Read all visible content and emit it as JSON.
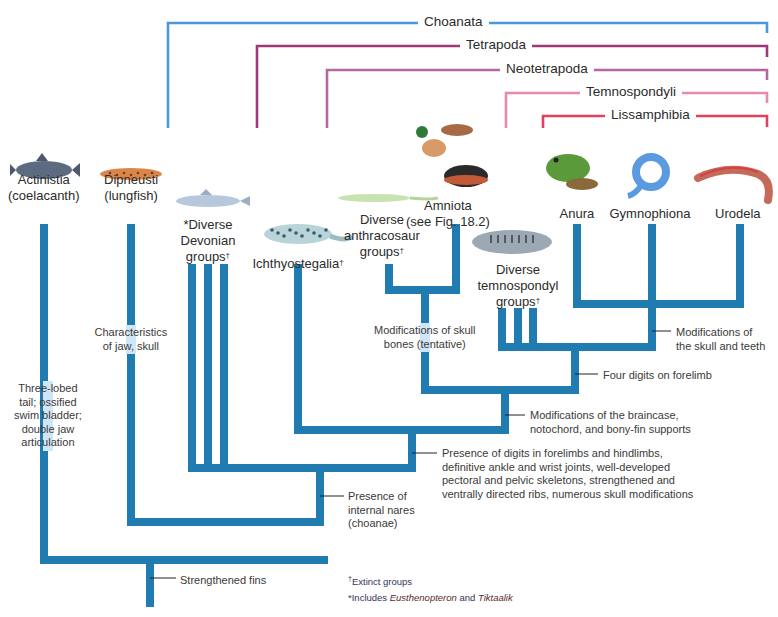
{
  "colors": {
    "trunk": "#1f7bb0",
    "trunk_highlight": "#cfe6f7",
    "choanata": "#4a97dd",
    "tetrapoda": "#a03878",
    "neotetrapoda": "#b5679f",
    "temnospondyli": "#e88aae",
    "lissamphibia": "#e2405c",
    "text": "#2b2b2b"
  },
  "clades": [
    {
      "id": "choanata",
      "label": "Choanata",
      "x1": 168,
      "x2": 767,
      "y": 23,
      "drop_left": 128,
      "drop_right": 33,
      "label_x": 418
    },
    {
      "id": "tetrapoda",
      "label": "Tetrapoda",
      "x1": 257,
      "x2": 767,
      "y": 46,
      "drop_left": 128,
      "drop_right": 57,
      "label_x": 460
    },
    {
      "id": "neotetrapoda",
      "label": "Neotetrapoda",
      "x1": 327,
      "x2": 767,
      "y": 70,
      "drop_left": 128,
      "drop_right": 80,
      "label_x": 500
    },
    {
      "id": "temnospondyli",
      "label": "Temnospondyli",
      "x1": 506,
      "x2": 767,
      "y": 93,
      "drop_left": 128,
      "drop_right": 103,
      "label_x": 580
    },
    {
      "id": "lissamphibia",
      "label": "Lissamphibia",
      "x1": 543,
      "x2": 767,
      "y": 116,
      "drop_left": 128,
      "drop_right": 127,
      "label_x": 605
    }
  ],
  "taxa": [
    {
      "id": "actinistia",
      "line1": "Actinistia",
      "line2": "(coelacanth)",
      "cx": 44,
      "y": 172,
      "extinct": false,
      "animal": "coelacanth"
    },
    {
      "id": "dipneusti",
      "line1": "Dipneusti",
      "line2": "(lungfish)",
      "cx": 131,
      "y": 172,
      "extinct": false,
      "animal": "lungfish"
    },
    {
      "id": "devonian",
      "line1": "*Diverse",
      "line2": "Devonian",
      "line3": "groups",
      "cx": 208,
      "y": 217,
      "extinct": true,
      "animal": "devonian-fish"
    },
    {
      "id": "ichthyostegalia",
      "line1": "Ichthyostegalia",
      "cx": 298,
      "y": 256,
      "extinct": true,
      "animal": "ichthyostega"
    },
    {
      "id": "anthracosaur",
      "line1": "Diverse",
      "line2": "anthracosaur",
      "line3": "groups",
      "cx": 382,
      "y": 212,
      "extinct": true,
      "animal": "anthracosaur"
    },
    {
      "id": "amniota",
      "line1": "Amniota",
      "line2": "(see Fig. 18.2)",
      "cx": 448,
      "y": 198,
      "extinct": false,
      "animal": "amniotes"
    },
    {
      "id": "temnospondyl",
      "line1": "Diverse",
      "line2": "temnospondyl",
      "line3": "groups",
      "cx": 518,
      "y": 262,
      "extinct": true,
      "animal": "temnospondyl"
    },
    {
      "id": "anura",
      "line1": "Anura",
      "cx": 577,
      "y": 206,
      "extinct": false,
      "animal": "frog"
    },
    {
      "id": "gymnophiona",
      "line1": "Gymnophiona",
      "cx": 650,
      "y": 206,
      "extinct": false,
      "animal": "caecilian"
    },
    {
      "id": "urodela",
      "line1": "Urodela",
      "cx": 738,
      "y": 206,
      "extinct": false,
      "animal": "salamander"
    }
  ],
  "characters": [
    {
      "id": "strengthened-fins",
      "text": [
        "Strengthened fins"
      ],
      "x": 180,
      "y": 574,
      "tick": [
        150,
        578,
        176
      ]
    },
    {
      "id": "internal-nares",
      "text": [
        "Presence of",
        "internal nares",
        "(choanae)"
      ],
      "x": 348,
      "y": 490,
      "tick": [
        320,
        496,
        344
      ]
    },
    {
      "id": "digits",
      "text": [
        "Presence of digits in forelimbs and hindlimbs,",
        "definitive ankle and wrist joints, well-developed",
        "pectoral and pelvic skeletons, strengthened and",
        "ventrally directed ribs, numerous skull modifications"
      ],
      "x": 442,
      "y": 447,
      "tick": [
        412,
        453,
        437
      ]
    },
    {
      "id": "braincase",
      "text": [
        "Modifications of the braincase,",
        "notochord, and bony-fin supports"
      ],
      "x": 530,
      "y": 409,
      "tick": [
        505,
        415,
        525
      ]
    },
    {
      "id": "four-digits",
      "text": [
        "Four digits on forelimb"
      ],
      "x": 603,
      "y": 369,
      "tick": [
        575,
        374,
        598
      ]
    },
    {
      "id": "skull-teeth",
      "text": [
        "Modifications of",
        "the skull and teeth"
      ],
      "x": 676,
      "y": 326,
      "tick": [
        652,
        331,
        671
      ]
    },
    {
      "id": "skull-bones",
      "text": [
        "Modifications of skull",
        "bones (tentative)"
      ],
      "x": 425,
      "y": 324,
      "center": true,
      "highlight_x": 425
    },
    {
      "id": "jaw-skull",
      "text": [
        "Characteristics",
        "of jaw, skull"
      ],
      "x": 131,
      "y": 326,
      "center": true
    },
    {
      "id": "three-lobed",
      "text": [
        "Three-lobed",
        "tail; ossified",
        "swim bladder;",
        "double jaw",
        "articulation"
      ],
      "x": 48,
      "y": 382,
      "center": true
    }
  ],
  "footnotes": {
    "extinct": "Extinct groups",
    "includes_prefix": "Includes ",
    "genus1": "Eusthenopteron",
    "and": " and ",
    "genus2": "Tiktaalik"
  },
  "tree": {
    "stroke_width": 8,
    "segments": [
      [
        150,
        603,
        150,
        560
      ],
      [
        44,
        560,
        324,
        560
      ],
      [
        44,
        560,
        44,
        228
      ],
      [
        131,
        522,
        131,
        228
      ],
      [
        131,
        522,
        320,
        522
      ],
      [
        320,
        522,
        320,
        468
      ],
      [
        192,
        468,
        412,
        468
      ],
      [
        192,
        468,
        192,
        268
      ],
      [
        208,
        468,
        208,
        268
      ],
      [
        224,
        468,
        224,
        268
      ],
      [
        412,
        468,
        412,
        430
      ],
      [
        298,
        430,
        505,
        430
      ],
      [
        298,
        430,
        298,
        268
      ],
      [
        505,
        430,
        505,
        390
      ],
      [
        425,
        390,
        575,
        390
      ],
      [
        425,
        390,
        425,
        290
      ],
      [
        389,
        290,
        456,
        290
      ],
      [
        389,
        290,
        389,
        268
      ],
      [
        456,
        290,
        456,
        228
      ],
      [
        575,
        390,
        575,
        347
      ],
      [
        502,
        347,
        652,
        347
      ],
      [
        502,
        347,
        502,
        312
      ],
      [
        518,
        347,
        518,
        312
      ],
      [
        533,
        347,
        533,
        312
      ],
      [
        652,
        347,
        652,
        304
      ],
      [
        577,
        304,
        740,
        304
      ],
      [
        577,
        304,
        577,
        228
      ],
      [
        652,
        304,
        652,
        228
      ],
      [
        740,
        304,
        740,
        228
      ]
    ]
  }
}
